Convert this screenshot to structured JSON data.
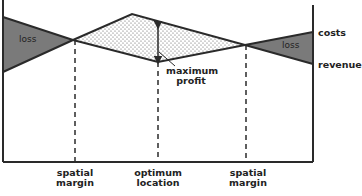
{
  "diagram": {
    "line_labels": {
      "costs": "costs",
      "revenue": "revenue"
    },
    "region_labels": {
      "loss_left": "loss",
      "loss_right": "loss",
      "max_profit_line1": "maximum",
      "max_profit_line2": "profit"
    },
    "x_labels": [
      {
        "line1": "spatial",
        "line2": "margin"
      },
      {
        "line1": "optimum",
        "line2": "location"
      },
      {
        "line1": "spatial",
        "line2": "margin"
      }
    ],
    "colors": {
      "loss_fill": "#7a7a7a",
      "line": "#2a2a2a",
      "profit_dots": "#555555"
    }
  }
}
